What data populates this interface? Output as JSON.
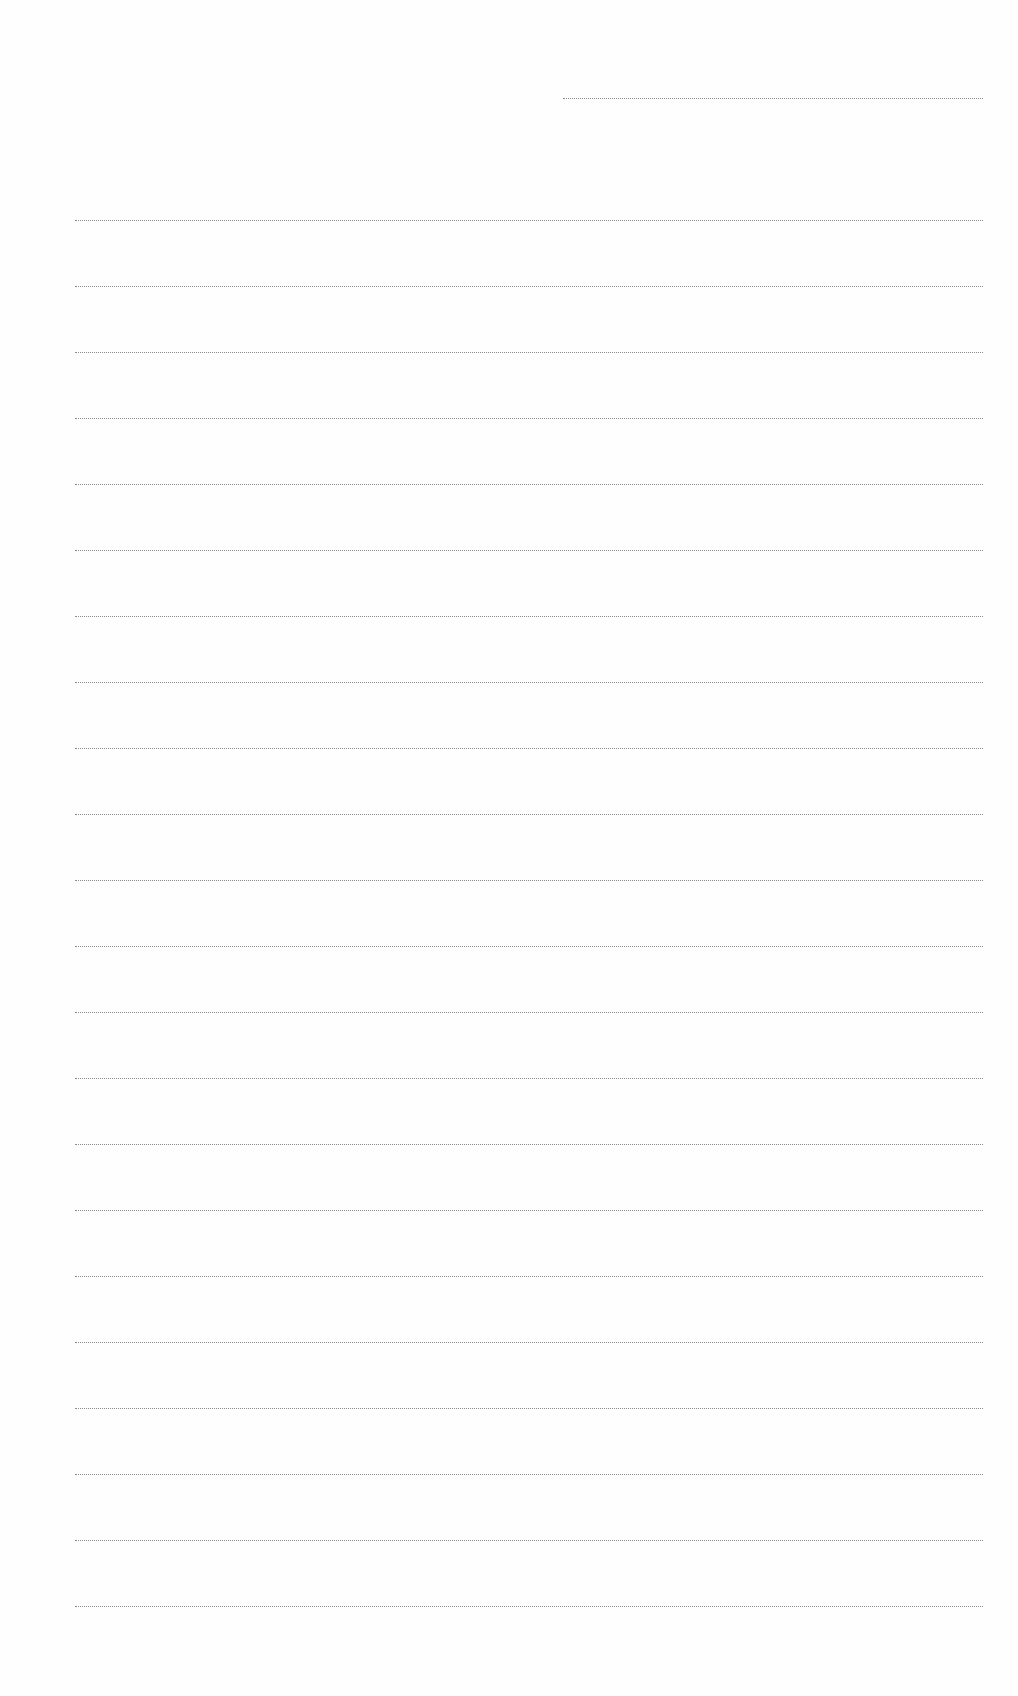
{
  "document": {
    "type": "blank ruled sheet",
    "header_line": {
      "kind": "short",
      "y": 98
    },
    "ruled_lines": {
      "count": 22,
      "start_y": 220,
      "spacing": 66
    },
    "text_content": []
  },
  "colors": {
    "paper": "#fefefe",
    "rule": "#8a8a8a"
  }
}
